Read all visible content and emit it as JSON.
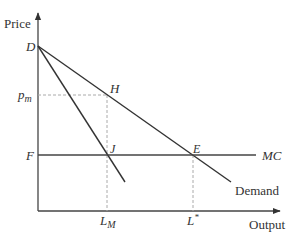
{
  "diagram": {
    "type": "economics-monopoly-vs-competition",
    "axes": {
      "y_label": "Price",
      "x_label": "Output"
    },
    "points": {
      "D": {
        "label": "D",
        "x": 38,
        "y": 46
      },
      "H": {
        "label": "H",
        "x": 107,
        "y": 95
      },
      "J": {
        "label": "J",
        "x": 107,
        "y": 155
      },
      "E": {
        "label": "E",
        "x": 193,
        "y": 155
      },
      "F": {
        "label": "F",
        "x": 38,
        "y": 155
      }
    },
    "lines": {
      "demand": {
        "label": "Demand",
        "from": [
          38,
          46
        ],
        "to": [
          231,
          182
        ]
      },
      "marginal_revenue": {
        "from": [
          38,
          46
        ],
        "to": [
          125,
          182
        ]
      },
      "marginal_cost": {
        "label": "MC",
        "y": 155,
        "x_end": 256
      }
    },
    "tick_labels": {
      "p_m": {
        "base": "p",
        "sub": "m"
      },
      "L_M": {
        "base": "L",
        "sub": "M"
      },
      "L_star": {
        "base": "L",
        "sup": "*"
      }
    },
    "colors": {
      "line": "#333333",
      "axis": "#555555",
      "dashed": "#999999"
    }
  }
}
